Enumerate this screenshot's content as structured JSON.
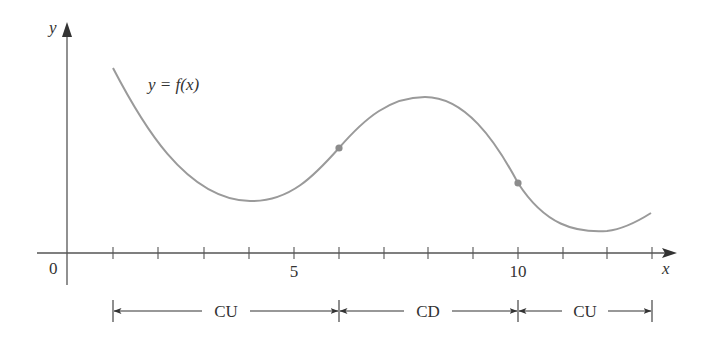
{
  "figure": {
    "axes": {
      "x_label": "x",
      "y_label": "y",
      "origin_label": "0",
      "tick_labels": [
        {
          "value": 5,
          "text": "5"
        },
        {
          "value": 10,
          "text": "10"
        }
      ],
      "tick_positions": [
        1,
        2,
        3,
        4,
        5,
        6,
        7,
        8,
        9,
        10,
        11,
        12,
        13
      ]
    },
    "curve": {
      "label": "y = f(x)",
      "color": "#9a9a9a",
      "inflection_points": [
        {
          "x": 6,
          "label": "inflection-point-1"
        },
        {
          "x": 10,
          "label": "inflection-point-2"
        }
      ]
    },
    "intervals": [
      {
        "label": "CU",
        "from": 1,
        "to": 6
      },
      {
        "label": "CD",
        "from": 6,
        "to": 10
      },
      {
        "label": "CU",
        "from": 10,
        "to": 13
      }
    ],
    "colors": {
      "axis": "#444444",
      "curve": "#9a9a9a",
      "point": "#8c8c8c",
      "text": "#333333"
    }
  }
}
